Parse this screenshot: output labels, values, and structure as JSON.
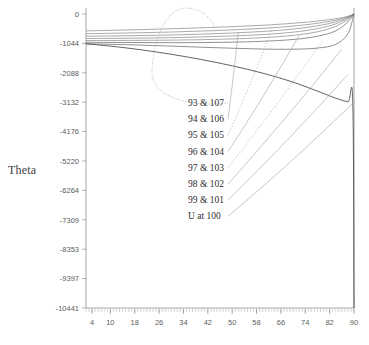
{
  "chart_data": {
    "type": "line",
    "title": "",
    "xlabel": "",
    "ylabel": "Theta",
    "xlim": [
      2,
      90
    ],
    "ylim": [
      -10441,
      0
    ],
    "grid": false,
    "legend_position": "inside-center",
    "x_ticks": [
      4,
      10,
      18,
      26,
      34,
      42,
      50,
      58,
      66,
      74,
      82,
      90
    ],
    "y_ticks": [
      0,
      -1044,
      -2088,
      -3132,
      -4176,
      -5220,
      -6264,
      -7309,
      -8353,
      -9397,
      -10441
    ],
    "x_tick_labels": [
      "4",
      "10",
      "18",
      "26",
      "34",
      "42",
      "50",
      "58",
      "66",
      "74",
      "82",
      "90"
    ],
    "y_tick_labels": [
      "0",
      "-1044",
      "-2088",
      "-3132",
      "-4176",
      "-5220",
      "-6264",
      "-7309",
      "-8353",
      "-9397",
      "-10441"
    ],
    "annotations": [
      "93 & 107",
      "94 & 106",
      "95 & 105",
      "96 & 104",
      "97 & 103",
      "98 & 102",
      "99 & 101",
      "U at 100"
    ],
    "series": [
      {
        "name": "93 & 107",
        "x": [
          2,
          10,
          20,
          30,
          40,
          50,
          60,
          70,
          78,
          84,
          88,
          90
        ],
        "values": [
          -600,
          -580,
          -555,
          -525,
          -490,
          -450,
          -400,
          -330,
          -250,
          -170,
          -80,
          0
        ]
      },
      {
        "name": "94 & 106",
        "x": [
          2,
          10,
          20,
          30,
          40,
          50,
          60,
          70,
          78,
          84,
          88,
          90
        ],
        "values": [
          -700,
          -685,
          -665,
          -640,
          -605,
          -565,
          -510,
          -430,
          -330,
          -220,
          -100,
          0
        ]
      },
      {
        "name": "95 & 105",
        "x": [
          2,
          10,
          20,
          30,
          40,
          50,
          60,
          70,
          78,
          84,
          88,
          90
        ],
        "values": [
          -790,
          -780,
          -765,
          -745,
          -715,
          -675,
          -620,
          -535,
          -420,
          -280,
          -120,
          0
        ]
      },
      {
        "name": "96 & 104",
        "x": [
          2,
          10,
          20,
          30,
          40,
          50,
          60,
          70,
          78,
          84,
          88,
          90
        ],
        "values": [
          -870,
          -865,
          -855,
          -840,
          -815,
          -780,
          -730,
          -645,
          -520,
          -350,
          -150,
          0
        ]
      },
      {
        "name": "97 & 103",
        "x": [
          2,
          10,
          20,
          30,
          40,
          50,
          60,
          70,
          78,
          84,
          88,
          90
        ],
        "values": [
          -940,
          -940,
          -935,
          -928,
          -912,
          -885,
          -840,
          -760,
          -630,
          -440,
          -190,
          0
        ]
      },
      {
        "name": "98 & 102",
        "x": [
          2,
          10,
          20,
          30,
          40,
          50,
          60,
          70,
          78,
          84,
          88,
          90
        ],
        "values": [
          -1005,
          -1010,
          -1015,
          -1018,
          -1015,
          -1000,
          -970,
          -905,
          -790,
          -600,
          -280,
          0
        ]
      },
      {
        "name": "99 & 101",
        "x": [
          2,
          10,
          20,
          30,
          40,
          50,
          60,
          70,
          78,
          84,
          88,
          90
        ],
        "values": [
          -1055,
          -1075,
          -1105,
          -1140,
          -1180,
          -1215,
          -1245,
          -1250,
          -1210,
          -1080,
          -700,
          0
        ]
      },
      {
        "name": "U at 100",
        "x": [
          2,
          10,
          20,
          30,
          40,
          50,
          60,
          70,
          78,
          84,
          88,
          89.6,
          90
        ],
        "values": [
          -1060,
          -1140,
          -1270,
          -1430,
          -1620,
          -1840,
          -2100,
          -2420,
          -2740,
          -2990,
          -3120,
          -3140,
          -10441
        ]
      }
    ]
  },
  "axis": {
    "y_title": "Theta"
  }
}
